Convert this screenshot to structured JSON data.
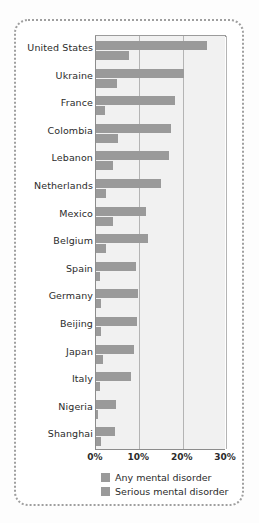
{
  "chart_data": {
    "type": "bar",
    "orientation": "horizontal",
    "title": "",
    "xlabel": "",
    "ylabel": "",
    "xlim": [
      0,
      30
    ],
    "xticks": [
      "0%",
      "10%",
      "20%",
      "30%"
    ],
    "xtick_values": [
      0,
      10,
      20,
      30
    ],
    "grid": "vertical",
    "legend_position": "bottom",
    "categories": [
      "United States",
      "Ukraine",
      "France",
      "Colombia",
      "Lebanon",
      "Netherlands",
      "Mexico",
      "Belgium",
      "Spain",
      "Germany",
      "Beijing",
      "Japan",
      "Italy",
      "Nigeria",
      "Shanghai"
    ],
    "series": [
      {
        "name": "Any mental disorder",
        "color": "#9a9a9a",
        "values": [
          25.7,
          20.2,
          18.2,
          17.2,
          16.8,
          14.9,
          11.5,
          12.0,
          9.2,
          9.7,
          9.4,
          8.7,
          8.0,
          4.7,
          4.3
        ]
      },
      {
        "name": "Serious mental disorder",
        "color": "#9a9a9a",
        "values": [
          7.6,
          4.8,
          2.1,
          5.1,
          3.9,
          2.3,
          3.9,
          2.4,
          1.0,
          1.2,
          1.2,
          1.5,
          1.0,
          0.4,
          1.1
        ]
      }
    ]
  },
  "legend": {
    "items": [
      {
        "label": "Any mental disorder"
      },
      {
        "label": "Serious mental disorder"
      }
    ]
  },
  "colors": {
    "bar": "#9a9a9a",
    "plot_background": "#f1f1f1",
    "gridline": "#b4b4b4",
    "axis": "#8c8c8c",
    "frame_border": "#9f9f9f",
    "text": "#2b2b2b"
  }
}
